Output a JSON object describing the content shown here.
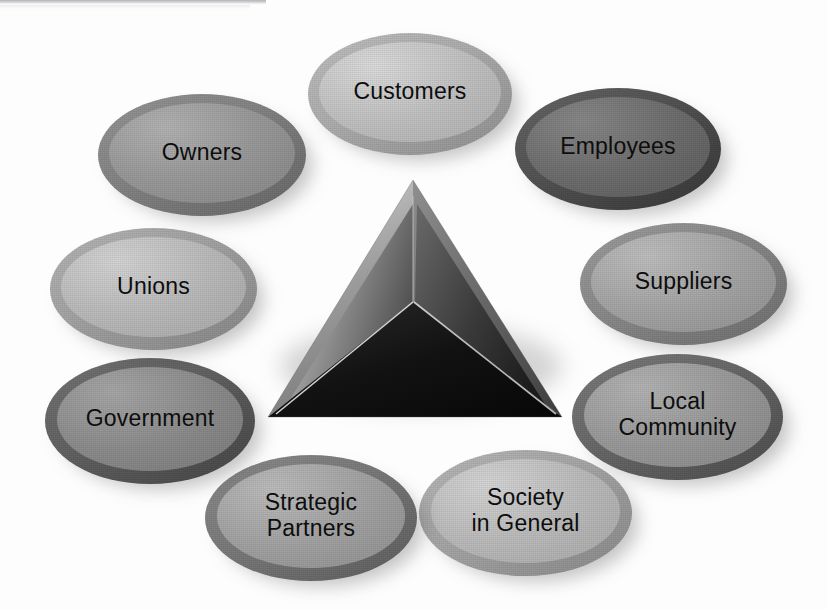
{
  "figure": {
    "kind": "stakeholder-wheel-diagram",
    "background_color": "#fdfdfd",
    "center": {
      "name": "central-pyramid",
      "shape": "tetrahedron",
      "label": "",
      "facet_colors": {
        "left": "#8d8d8d",
        "right": "#4a4a4a",
        "bottom": "#151515",
        "outer_left_bevel": "#a5a5a5",
        "outer_right_bevel": "#6d6d6d"
      }
    },
    "nodes": [
      {
        "id": "customers",
        "label": "Customers",
        "position": "top",
        "face_color": "#c3c3c3",
        "rim_color": "#b0b0b0",
        "x": 308,
        "y": 33,
        "w": 204,
        "h": 122,
        "font_size": 23
      },
      {
        "id": "employees",
        "label": "Employees",
        "position": "upper-right",
        "face_color": "#6f6f6f",
        "rim_color": "#555555",
        "x": 515,
        "y": 88,
        "w": 206,
        "h": 122,
        "font_size": 23
      },
      {
        "id": "suppliers",
        "label": "Suppliers",
        "position": "right",
        "face_color": "#a6a6a6",
        "rim_color": "#8d8d8d",
        "x": 580,
        "y": 223,
        "w": 207,
        "h": 122,
        "font_size": 23
      },
      {
        "id": "local-community",
        "label": "Local\nCommunity",
        "position": "lower-right",
        "face_color": "#9b9b9b",
        "rim_color": "#6b6b6b",
        "x": 572,
        "y": 354,
        "w": 211,
        "h": 126,
        "font_size": 23
      },
      {
        "id": "society-in-general",
        "label": "Society\nin General",
        "position": "bottom-right",
        "face_color": "#bdbdbd",
        "rim_color": "#a9a9a9",
        "x": 419,
        "y": 450,
        "w": 213,
        "h": 126,
        "font_size": 23
      },
      {
        "id": "strategic-partners",
        "label": "Strategic\nPartners",
        "position": "bottom-left",
        "face_color": "#a4a4a4",
        "rim_color": "#7d7d7d",
        "x": 205,
        "y": 455,
        "w": 212,
        "h": 126,
        "font_size": 23
      },
      {
        "id": "government",
        "label": "Government",
        "position": "lower-left",
        "face_color": "#8e8e8e",
        "rim_color": "#646464",
        "x": 45,
        "y": 358,
        "w": 210,
        "h": 126,
        "font_size": 23
      },
      {
        "id": "unions",
        "label": "Unions",
        "position": "left",
        "face_color": "#bcbcbc",
        "rim_color": "#a6a6a6",
        "x": 50,
        "y": 228,
        "w": 207,
        "h": 122,
        "font_size": 23
      },
      {
        "id": "owners",
        "label": "Owners",
        "position": "upper-left",
        "face_color": "#9a9a9a",
        "rim_color": "#868686",
        "x": 98,
        "y": 94,
        "w": 208,
        "h": 122,
        "font_size": 23
      }
    ],
    "artifact": {
      "name": "scan-line-artifact",
      "description": "faint dark horizontal scan band at top-left edge"
    }
  }
}
